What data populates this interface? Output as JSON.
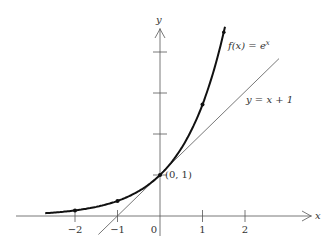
{
  "chart_data": {
    "type": "line",
    "title": "",
    "xlabel": "x",
    "ylabel": "y",
    "xlim": [
      -2.7,
      2.9
    ],
    "ylim": [
      -0.5,
      4.9
    ],
    "grid": false,
    "x_ticks": [
      -2,
      -1,
      0,
      1,
      2
    ],
    "x_tick_labels": [
      "−2",
      "−1",
      "0",
      "1",
      "2"
    ],
    "y_ticks": [
      1,
      2,
      3,
      4
    ],
    "series": [
      {
        "name": "f(x) = e^x",
        "label_main": "f(x) = e",
        "label_sup": "x",
        "style": "thick",
        "x_range": [
          -2.7,
          1.53
        ],
        "marked_points": [
          {
            "x": -2,
            "y": 0.135
          },
          {
            "x": -1,
            "y": 0.368
          },
          {
            "x": 0,
            "y": 1
          },
          {
            "x": 1,
            "y": 2.718
          },
          {
            "x": 1.5,
            "y": 4.48
          }
        ]
      },
      {
        "name": "y = x + 1",
        "label": "y = x + 1",
        "style": "thin",
        "x_range": [
          -1.45,
          2.8
        ]
      }
    ],
    "annotations": [
      {
        "text": "(0, 1)",
        "x": 0,
        "y": 1
      }
    ]
  },
  "axes": {
    "x_label": "x",
    "y_label": "y"
  },
  "labels": {
    "point": "(0, 1)",
    "exp_main": "f(x) = e",
    "exp_sup": "x",
    "line": "y = x + 1"
  },
  "ticks": {
    "x": [
      "−2",
      "−1",
      "0",
      "1",
      "2"
    ]
  }
}
